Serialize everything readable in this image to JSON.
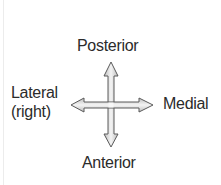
{
  "diagram": {
    "labels": {
      "top": "Posterior",
      "bottom": "Anterior",
      "right": "Medial",
      "left_line1": "Lateral",
      "left_line2": "(right)"
    },
    "arrow": {
      "type": "four-way-double-headed",
      "fill_color": "#d9d9d9",
      "stroke_color": "#5a5a5a"
    },
    "text_color": "#2b2b2b"
  }
}
